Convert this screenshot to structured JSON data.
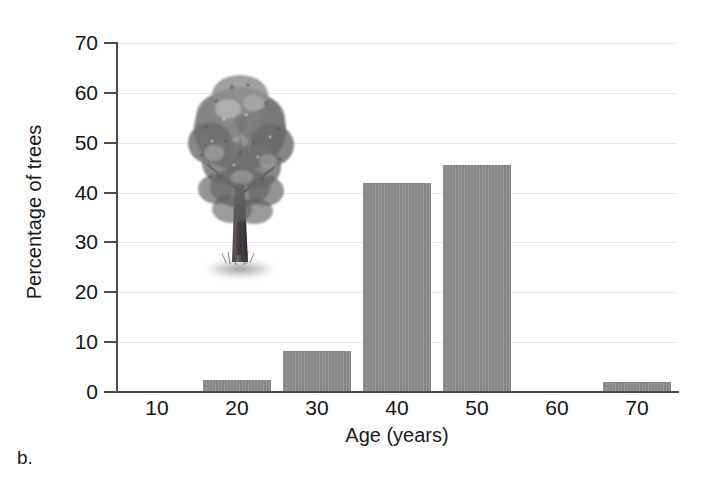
{
  "panel": {
    "letter": "b."
  },
  "chart_data": {
    "type": "bar",
    "title": "",
    "xlabel": "Age (years)",
    "ylabel": "Percentage of trees",
    "categories": [
      "10",
      "20",
      "30",
      "40",
      "50",
      "60",
      "70"
    ],
    "values": [
      0,
      2.5,
      8.2,
      42,
      45.6,
      0,
      2
    ],
    "xlim": [
      5,
      75
    ],
    "ylim": [
      0,
      70
    ],
    "ytick_labels": [
      "0",
      "10",
      "20",
      "30",
      "40",
      "50",
      "60",
      "70"
    ],
    "ytick_values": [
      0,
      10,
      20,
      30,
      40,
      50,
      60,
      70
    ],
    "xtick_labels": [
      "10",
      "20",
      "30",
      "40",
      "50",
      "60",
      "70"
    ],
    "grid": "horizontal",
    "legend": "none",
    "bar_color": "#8c8c8c",
    "axis_color": "#4c4c4c",
    "grid_color": "#e9e9e9"
  },
  "illustration": {
    "name": "deciduous-tree-illustration",
    "alt": "Grayscale drawing of a broad-crowned deciduous tree"
  }
}
